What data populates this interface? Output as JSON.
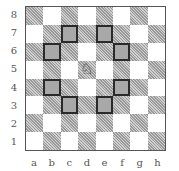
{
  "diagram": {
    "type": "chessboard",
    "files": [
      "a",
      "b",
      "c",
      "d",
      "e",
      "f",
      "g",
      "h"
    ],
    "ranks": [
      "8",
      "7",
      "6",
      "5",
      "4",
      "3",
      "2",
      "1"
    ],
    "piece": {
      "name": "white-knight",
      "glyph": "♘",
      "square": "d5"
    },
    "highlighted_squares": [
      "c7",
      "e7",
      "b6",
      "f6",
      "b4",
      "f4",
      "c3",
      "e3"
    ],
    "colors": {
      "light": "#ffffff",
      "dark_hatch": "#b0b0b0",
      "highlight_fill": "#a8a8a8",
      "highlight_border": "#2a2a2a"
    }
  }
}
